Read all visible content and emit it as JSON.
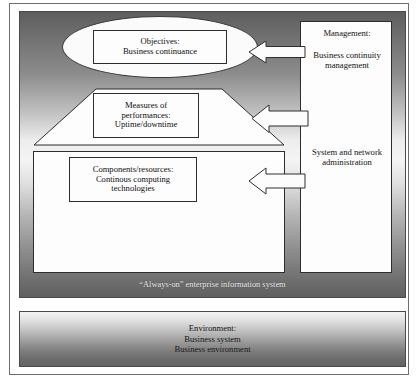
{
  "diagram": {
    "objectives": {
      "line1": "Objectives:",
      "line2": "Business continuance"
    },
    "measures": {
      "line1": "Measures of",
      "line2": "performances:",
      "line3": "Uptime/downtime"
    },
    "components": {
      "line1": "Components/resources:",
      "line2": "Continous computing",
      "line3": "technologies"
    },
    "right_panel": {
      "management_title": "Management:",
      "management_body": "Business continuity management",
      "system_network": "System and network administration"
    },
    "system_caption": "“Always-on” enterprise information system",
    "environment": {
      "line1": "Environment:",
      "line2": "Business system",
      "line3": "Business environment"
    },
    "arrows": [
      {
        "name": "arrow-management-to-objectives",
        "direction": "left"
      },
      {
        "name": "arrow-management-to-measures",
        "direction": "left"
      },
      {
        "name": "arrow-sysnet-to-components",
        "direction": "left"
      }
    ],
    "colors": {
      "outline": "#2d2d2d",
      "frame": "#4a4a4a",
      "shape_fill": "#fdfdfd",
      "caption_text": "#f2f2f2",
      "body_text": "#0f0f0f"
    }
  }
}
